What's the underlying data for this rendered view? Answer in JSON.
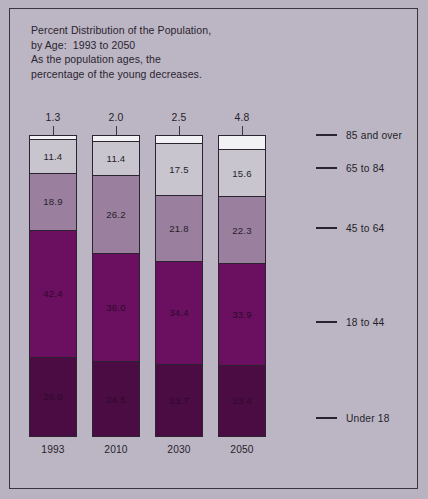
{
  "title_lines": "Percent Distribution of the Population,\nby Age:  1993 to 2050\nAs the population ages, the\npercentage of the young decreases.",
  "legend": [
    {
      "label": "85 and over"
    },
    {
      "label": "65 to 84"
    },
    {
      "label": "45 to 64"
    },
    {
      "label": "18 to 44"
    },
    {
      "label": "Under 18"
    }
  ],
  "top_labels": [
    "1.3",
    "2.0",
    "2.5",
    "4.8"
  ],
  "years": [
    "1993",
    "2010",
    "2030",
    "2050"
  ],
  "bars": [
    {
      "year": "1993",
      "segments": [
        {
          "group": "85 and over",
          "label": "",
          "value": 1.3
        },
        {
          "group": "65 to 84",
          "label": "11.4",
          "value": 11.4
        },
        {
          "group": "45 to 64",
          "label": "18.9",
          "value": 18.9
        },
        {
          "group": "18 to 44",
          "label": "42.4",
          "value": 42.4
        },
        {
          "group": "Under 18",
          "label": "26.0",
          "value": 26.0
        }
      ]
    },
    {
      "year": "2010",
      "segments": [
        {
          "group": "85 and over",
          "label": "",
          "value": 2.0
        },
        {
          "group": "65 to 84",
          "label": "11.4",
          "value": 11.4
        },
        {
          "group": "45 to 64",
          "label": "26.2",
          "value": 26.2
        },
        {
          "group": "18 to 44",
          "label": "36.0",
          "value": 36.0
        },
        {
          "group": "Under 18",
          "label": "24.5",
          "value": 24.5
        }
      ]
    },
    {
      "year": "2030",
      "segments": [
        {
          "group": "85 and over",
          "label": "",
          "value": 2.5
        },
        {
          "group": "65 to 84",
          "label": "17.5",
          "value": 17.5
        },
        {
          "group": "45 to 64",
          "label": "21.8",
          "value": 21.8
        },
        {
          "group": "18 to 44",
          "label": "34.4",
          "value": 34.4
        },
        {
          "group": "Under 18",
          "label": "23.7",
          "value": 23.7
        }
      ]
    },
    {
      "year": "2050",
      "segments": [
        {
          "group": "85 and over",
          "label": "",
          "value": 4.8
        },
        {
          "group": "65 to 84",
          "label": "15.6",
          "value": 15.6
        },
        {
          "group": "45 to 64",
          "label": "22.3",
          "value": 22.3
        },
        {
          "group": "18 to 44",
          "label": "33.9",
          "value": 33.9
        },
        {
          "group": "Under 18",
          "label": "23.4",
          "value": 23.4
        }
      ]
    }
  ],
  "colors": {
    "background": "#bcb5c3",
    "frame": "#3a3340",
    "c85": "#f2f1f3",
    "c6584": "#c9c5ce",
    "c4564": "#9a7f9e",
    "c1844": "#6b1060",
    "cu18": "#4a0c43",
    "text": "#241f2a"
  },
  "chart_data": {
    "type": "bar",
    "title": "Percent Distribution of the Population, by Age: 1993 to 2050",
    "subtitle": "As the population ages, the percentage of the young decreases.",
    "xlabel": "",
    "ylabel": "Percent",
    "ylim": [
      0,
      100
    ],
    "grid": false,
    "legend_position": "right",
    "stacked": true,
    "categories": [
      "1993",
      "2010",
      "2030",
      "2050"
    ],
    "series": [
      {
        "name": "85 and over",
        "values": [
          1.3,
          2.0,
          2.5,
          4.8
        ],
        "color": "#f2f1f3"
      },
      {
        "name": "65 to 84",
        "values": [
          11.4,
          11.4,
          17.5,
          15.6
        ],
        "color": "#c9c5ce"
      },
      {
        "name": "45 to 64",
        "values": [
          18.9,
          26.2,
          21.8,
          22.3
        ],
        "color": "#9a7f9e"
      },
      {
        "name": "18 to 44",
        "values": [
          42.4,
          36.0,
          34.4,
          33.9
        ],
        "color": "#6b1060"
      },
      {
        "name": "Under 18",
        "values": [
          26.0,
          24.5,
          23.7,
          23.4
        ],
        "color": "#4a0c43"
      }
    ],
    "annotations": [
      {
        "text": "1.3",
        "category": "1993",
        "series": "85 and over"
      },
      {
        "text": "2.0",
        "category": "2010",
        "series": "85 and over"
      },
      {
        "text": "2.5",
        "category": "2030",
        "series": "85 and over"
      },
      {
        "text": "4.8",
        "category": "2050",
        "series": "85 and over"
      }
    ]
  }
}
